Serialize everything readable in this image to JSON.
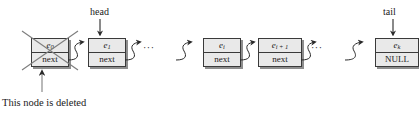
{
  "figure": {
    "background": "#ffffff",
    "node_fill": "#e9e9e9",
    "node_stroke": "#3a3a3a",
    "shadow": "#8e8e8e",
    "text_color": "#1a1a1a"
  },
  "pointers": {
    "head_label": "head",
    "tail_label": "tail"
  },
  "caption": {
    "deleted_note": "This node is deleted"
  },
  "ellipses": {
    "after_first_group": "···",
    "after_second_group": "···"
  },
  "nodes": [
    {
      "id": "node-e0",
      "element_label": "e",
      "element_subscript": "0",
      "next_label": "next",
      "deleted": true,
      "x": 31,
      "y": 38
    },
    {
      "id": "node-e1",
      "element_label": "e",
      "element_subscript": "1",
      "next_label": "next",
      "deleted": false,
      "x": 88,
      "y": 38
    },
    {
      "id": "node-ei",
      "element_label": "e",
      "element_subscript": "i",
      "next_label": "next",
      "deleted": false,
      "x": 203,
      "y": 38
    },
    {
      "id": "node-ei1",
      "element_label": "e",
      "element_subscript": "i + 1",
      "next_label": "next",
      "deleted": false,
      "x": 258,
      "y": 38
    },
    {
      "id": "node-ek",
      "element_label": "e",
      "element_subscript": "k",
      "next_label": "NULL",
      "deleted": false,
      "x": 375,
      "y": 38
    }
  ]
}
